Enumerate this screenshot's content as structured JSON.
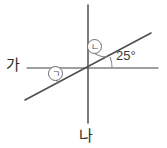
{
  "figure": {
    "width": 167,
    "height": 148,
    "background": "#ffffff",
    "stroke_color": "#7a7a7a",
    "text_color": "#2b2b2b"
  },
  "labels": {
    "line_horizontal": "가",
    "line_vertical": "나",
    "known_angle": "25°",
    "marker_giyeok": "ㄱ",
    "marker_nieun": "ㄴ"
  },
  "geometry": {
    "intersection": {
      "x": 88,
      "y": 68
    },
    "horizontal_line": {
      "x1": 27,
      "y1": 68,
      "x2": 158,
      "y2": 68
    },
    "vertical_line": {
      "x1": 88,
      "y1": 5,
      "x2": 88,
      "y2": 123
    },
    "diagonal_line": {
      "x1": 25,
      "y1": 100,
      "x2": 151,
      "y2": 33
    },
    "arcs": [
      {
        "name": "angle-giyeok-arc",
        "radius": 30
      },
      {
        "name": "angle-nieun-arc",
        "radius": 22
      },
      {
        "name": "angle-25-arc",
        "radius": 22
      }
    ]
  }
}
